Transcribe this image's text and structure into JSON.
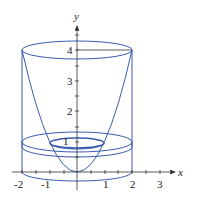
{
  "figure": {
    "colors": {
      "curve": "#3a5bb0",
      "axis": "#333333",
      "background": "#ffffff"
    },
    "axes": {
      "x_label": "x",
      "y_label": "y",
      "x_ticks": [
        "-2",
        "-1",
        "1",
        "2",
        "3"
      ],
      "y_ticks": [
        "1",
        "2",
        "3",
        "4"
      ]
    }
  }
}
